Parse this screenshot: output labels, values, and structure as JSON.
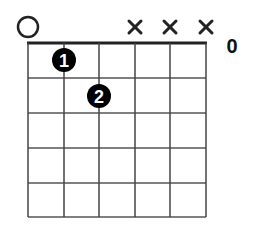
{
  "chord": {
    "strings": 6,
    "frets": 5,
    "starting_fret_label": "0",
    "string_markers": [
      "open",
      "",
      "",
      "muted",
      "muted",
      "muted"
    ],
    "fingers": [
      {
        "label": "1",
        "string": 1,
        "fret": 1
      },
      {
        "label": "2",
        "string": 2,
        "fret": 2
      }
    ]
  },
  "colors": {
    "line": "#333333",
    "dot": "#000000",
    "dot_text": "#ffffff"
  }
}
